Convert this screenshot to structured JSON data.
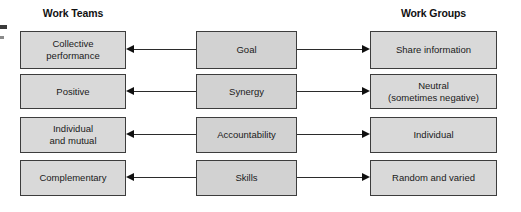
{
  "headers": {
    "left": "Work Teams",
    "right": "Work Groups"
  },
  "colors": {
    "node_fill": "#d9d9d9",
    "node_fill_mid": "#d2d2d2",
    "node_border": "#3d3d3d",
    "connector": "#2b2b2b",
    "arrowhead": "#101010",
    "background": "#ffffff",
    "text": "#1a1a1a"
  },
  "rows": [
    {
      "left": "Collective\nperformance",
      "left_line1": "Collective",
      "left_line2": "performance",
      "middle": "Goal",
      "right": "Share information",
      "right_line1": "Share information",
      "right_line2": ""
    },
    {
      "left": "Positive",
      "left_line1": "Positive",
      "left_line2": "",
      "middle": "Synergy",
      "right": "Neutral\n(sometimes negative)",
      "right_line1": "Neutral",
      "right_line2": "(sometimes negative)"
    },
    {
      "left": "Individual\nand mutual",
      "left_line1": "Individual",
      "left_line2": "and mutual",
      "middle": "Accountability",
      "right": "Individual",
      "right_line1": "Individual",
      "right_line2": ""
    },
    {
      "left": "Complementary",
      "left_line1": "Complementary",
      "left_line2": "",
      "middle": "Skills",
      "right": "Random and varied",
      "right_line1": "Random and varied",
      "right_line2": ""
    }
  ]
}
